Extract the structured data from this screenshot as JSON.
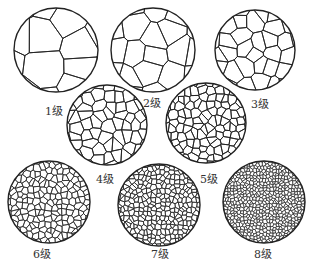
{
  "figure": {
    "type": "grain-size-grade-chart",
    "background": "#ffffff",
    "line_color": "#222222",
    "panels": [
      {
        "grade": 1,
        "label": "1级",
        "cx": 56,
        "cy": 50,
        "r": 42,
        "lx": 54,
        "ly": 110,
        "cells": 6
      },
      {
        "grade": 2,
        "label": "2级",
        "cx": 153,
        "cy": 50,
        "r": 42,
        "lx": 152,
        "ly": 102,
        "cells": 12
      },
      {
        "grade": 3,
        "label": "3级",
        "cx": 255,
        "cy": 50,
        "r": 40,
        "lx": 260,
        "ly": 103,
        "cells": 24
      },
      {
        "grade": 4,
        "label": "4级",
        "cx": 107,
        "cy": 125,
        "r": 40,
        "lx": 105,
        "ly": 178,
        "cells": 48
      },
      {
        "grade": 5,
        "label": "5级",
        "cx": 206,
        "cy": 123,
        "r": 40,
        "lx": 209,
        "ly": 178,
        "cells": 90
      },
      {
        "grade": 6,
        "label": "6级",
        "cx": 49,
        "cy": 202,
        "r": 41,
        "lx": 42,
        "ly": 253,
        "cells": 160
      },
      {
        "grade": 7,
        "label": "7级",
        "cx": 159,
        "cy": 205,
        "r": 41,
        "lx": 160,
        "ly": 253,
        "cells": 260
      },
      {
        "grade": 8,
        "label": "8级",
        "cx": 264,
        "cy": 202,
        "r": 41,
        "lx": 263,
        "ly": 253,
        "cells": 520
      }
    ]
  }
}
